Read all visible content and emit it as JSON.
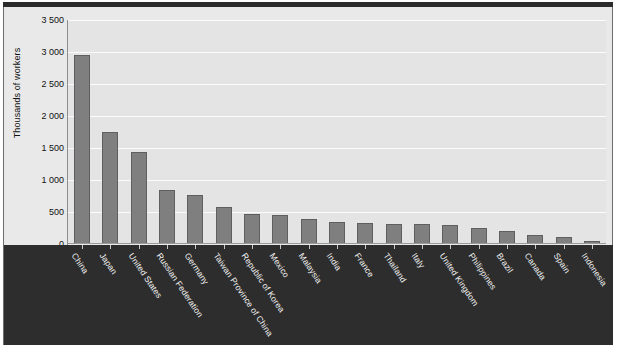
{
  "chart_data": {
    "type": "bar",
    "title": "",
    "xlabel": "",
    "ylabel": "Thousands of workers",
    "ylim": [
      0,
      3500
    ],
    "ytick_step": 500,
    "grid": true,
    "legend": false,
    "bar_color": "#7f7f7f",
    "plot_background": "#e4e4e4",
    "label_panel_background": "#2d2d2d",
    "label_text_color": "#f2f2f2",
    "ytick_labels": [
      "3 500",
      "3 000",
      "2 500",
      "2 000",
      "1 500",
      "1 000",
      "500",
      "0"
    ],
    "ytick_values": [
      3500,
      3000,
      2500,
      2000,
      1500,
      1000,
      500,
      0
    ],
    "categories": [
      "China",
      "Japan",
      "United States",
      "Russian Federation",
      "Germany",
      "Taiwan Province of China",
      "Republic of Korea",
      "Mexico",
      "Malaysia",
      "India",
      "France",
      "Thailand",
      "Italy",
      "United Kingdom",
      "Philippines",
      "Brazil",
      "Canada",
      "Spain",
      "Indonesia"
    ],
    "values": [
      2950,
      1750,
      1430,
      850,
      760,
      580,
      470,
      450,
      390,
      340,
      330,
      320,
      320,
      290,
      250,
      200,
      140,
      110,
      50
    ]
  }
}
